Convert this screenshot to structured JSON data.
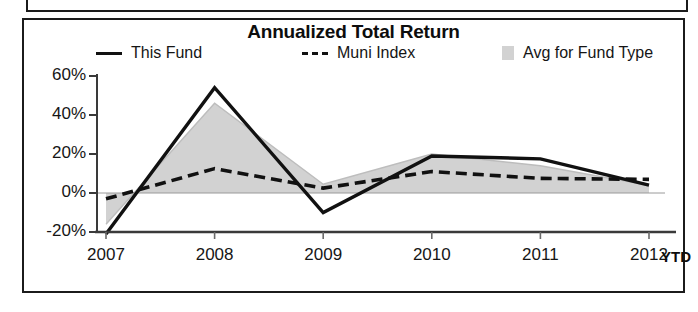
{
  "panel": {
    "title": "Annualized Total Return"
  },
  "legend": {
    "position": "top",
    "items": [
      {
        "label": "This Fund",
        "marker": "solid-line-swatch",
        "color": "#111111"
      },
      {
        "label": "Muni Index",
        "marker": "dashed-line-swatch",
        "color": "#111111"
      },
      {
        "label": "Avg for Fund Type",
        "marker": "area-fill-swatch",
        "color": "#d2d2d2"
      }
    ]
  },
  "axis": {
    "x_suffix_label": "YTD",
    "y_tick_labels": [
      "60%",
      "40%",
      "20%",
      "0%",
      "-20%"
    ],
    "x_tick_labels": [
      "2007",
      "2008",
      "2009",
      "2010",
      "2011",
      "2012"
    ]
  },
  "chart_data": {
    "type": "line",
    "title": "Annualized Total Return",
    "xlabel": "",
    "ylabel": "",
    "categories": [
      "2007",
      "2008",
      "2009",
      "2010",
      "2011",
      "2012"
    ],
    "x_axis_note": "2012 YTD",
    "ylim": [
      -30,
      60
    ],
    "ytick_values": [
      60,
      40,
      20,
      0,
      -20
    ],
    "ytick_labels": [
      "60%",
      "40%",
      "20%",
      "0%",
      "-20%"
    ],
    "grid": false,
    "legend_position": "top",
    "series": [
      {
        "name": "This Fund",
        "style": "solid",
        "color": "#111111",
        "values": [
          -21,
          54,
          -10,
          19,
          17.5,
          4
        ]
      },
      {
        "name": "Muni Index",
        "style": "dashed",
        "color": "#111111",
        "values": [
          -3,
          12.5,
          2.5,
          11,
          7.5,
          7
        ]
      },
      {
        "name": "Avg for Fund Type",
        "style": "area",
        "color": "#d2d2d2",
        "values": [
          -16,
          46,
          4.5,
          20,
          14,
          4
        ],
        "baseline": 0
      }
    ]
  }
}
